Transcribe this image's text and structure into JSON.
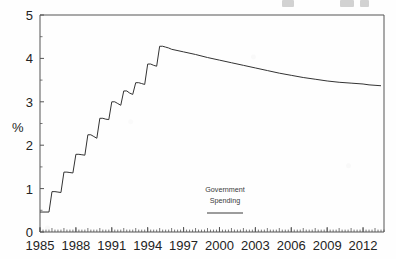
{
  "figure": {
    "background_color": "#fefefe",
    "line_color": "#333333",
    "axis_color": "#555555",
    "text_color": "#232323"
  },
  "axes": {
    "y_axis_title": "%",
    "y_ticks": [
      "0",
      "1",
      "2",
      "3",
      "4",
      "5"
    ],
    "x_ticks": [
      "1985",
      "1988",
      "1991",
      "1994",
      "1997",
      "2000",
      "2003",
      "2006",
      "2009",
      "2012"
    ]
  },
  "annotation": {
    "line1": "Government",
    "line2": "Spending",
    "legend_swatch": "solid-line"
  },
  "chart_data": {
    "type": "line",
    "title": "",
    "subtitle": "",
    "xlabel": "",
    "ylabel": "%",
    "xlim": [
      1985,
      2013.75
    ],
    "ylim": [
      0,
      5
    ],
    "y_ticks": [
      0,
      1,
      2,
      3,
      4,
      5
    ],
    "y_minor_tick_step": 0.5,
    "x_ticks": [
      1985,
      1988,
      1991,
      1994,
      1997,
      2000,
      2003,
      2006,
      2009,
      2012
    ],
    "x_minor_tick_step": 0.25,
    "grid": false,
    "legend_position": "inside-center-bottom",
    "series": [
      {
        "name": "Government Spending",
        "units": "percent",
        "points": [
          {
            "x": 1985.0,
            "y": 0.46
          },
          {
            "x": 1985.25,
            "y": 0.46
          },
          {
            "x": 1985.5,
            "y": 0.46
          },
          {
            "x": 1985.75,
            "y": 0.46
          },
          {
            "x": 1986.0,
            "y": 0.93
          },
          {
            "x": 1986.25,
            "y": 0.93
          },
          {
            "x": 1986.5,
            "y": 0.92
          },
          {
            "x": 1986.75,
            "y": 0.91
          },
          {
            "x": 1987.0,
            "y": 1.38
          },
          {
            "x": 1987.25,
            "y": 1.38
          },
          {
            "x": 1987.5,
            "y": 1.37
          },
          {
            "x": 1987.75,
            "y": 1.36
          },
          {
            "x": 1988.0,
            "y": 1.79
          },
          {
            "x": 1988.25,
            "y": 1.79
          },
          {
            "x": 1988.5,
            "y": 1.78
          },
          {
            "x": 1988.75,
            "y": 1.77
          },
          {
            "x": 1989.0,
            "y": 2.24
          },
          {
            "x": 1989.25,
            "y": 2.24
          },
          {
            "x": 1989.5,
            "y": 2.2
          },
          {
            "x": 1989.75,
            "y": 2.16
          },
          {
            "x": 1990.0,
            "y": 2.62
          },
          {
            "x": 1990.25,
            "y": 2.62
          },
          {
            "x": 1990.5,
            "y": 2.6
          },
          {
            "x": 1990.75,
            "y": 2.59
          },
          {
            "x": 1991.0,
            "y": 3.0
          },
          {
            "x": 1991.25,
            "y": 3.0
          },
          {
            "x": 1991.5,
            "y": 2.96
          },
          {
            "x": 1991.75,
            "y": 2.92
          },
          {
            "x": 1992.0,
            "y": 3.25
          },
          {
            "x": 1992.25,
            "y": 3.25
          },
          {
            "x": 1992.5,
            "y": 3.2
          },
          {
            "x": 1992.75,
            "y": 3.17
          },
          {
            "x": 1993.0,
            "y": 3.44
          },
          {
            "x": 1993.25,
            "y": 3.44
          },
          {
            "x": 1993.5,
            "y": 3.42
          },
          {
            "x": 1993.75,
            "y": 3.4
          },
          {
            "x": 1994.0,
            "y": 3.87
          },
          {
            "x": 1994.25,
            "y": 3.87
          },
          {
            "x": 1994.5,
            "y": 3.84
          },
          {
            "x": 1994.75,
            "y": 3.82
          },
          {
            "x": 1995.0,
            "y": 4.28
          },
          {
            "x": 1995.25,
            "y": 4.28
          },
          {
            "x": 1995.5,
            "y": 4.26
          },
          {
            "x": 1995.75,
            "y": 4.24
          },
          {
            "x": 1996.0,
            "y": 4.21
          },
          {
            "x": 1997.0,
            "y": 4.15
          },
          {
            "x": 1998.0,
            "y": 4.09
          },
          {
            "x": 1999.0,
            "y": 4.02
          },
          {
            "x": 2000.0,
            "y": 3.96
          },
          {
            "x": 2001.0,
            "y": 3.9
          },
          {
            "x": 2002.0,
            "y": 3.84
          },
          {
            "x": 2003.0,
            "y": 3.78
          },
          {
            "x": 2004.0,
            "y": 3.72
          },
          {
            "x": 2005.0,
            "y": 3.66
          },
          {
            "x": 2006.0,
            "y": 3.61
          },
          {
            "x": 2007.0,
            "y": 3.56
          },
          {
            "x": 2008.0,
            "y": 3.52
          },
          {
            "x": 2009.0,
            "y": 3.48
          },
          {
            "x": 2010.0,
            "y": 3.45
          },
          {
            "x": 2011.0,
            "y": 3.43
          },
          {
            "x": 2012.0,
            "y": 3.41
          },
          {
            "x": 2012.5,
            "y": 3.39
          },
          {
            "x": 2013.0,
            "y": 3.38
          },
          {
            "x": 2013.5,
            "y": 3.37
          }
        ]
      }
    ],
    "annotations": [
      {
        "text": "Government",
        "x": 2000.0,
        "y": 0.72
      },
      {
        "text": "Spending",
        "x": 2000.0,
        "y": 0.52
      }
    ]
  }
}
